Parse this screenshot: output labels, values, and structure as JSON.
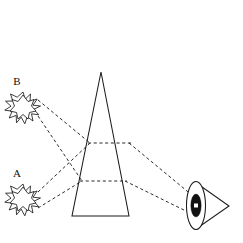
{
  "figure": {
    "background_color": "#ffffff",
    "stroke_color": "#1a1a1a",
    "ray_color": "#2b2b2b",
    "width": 243,
    "height": 243
  },
  "labels": {
    "source_b": "B",
    "source_a": "A"
  },
  "objects": {
    "source_b": {
      "name": "B",
      "shape": "star-burst",
      "points": 12,
      "center": {
        "x": 23,
        "y": 107
      },
      "outer_radius": 15,
      "inner_radius": 8
    },
    "source_a": {
      "name": "A",
      "shape": "star-burst",
      "points": 12,
      "center": {
        "x": 23,
        "y": 199
      },
      "outer_radius": 15,
      "inner_radius": 8
    },
    "prism": {
      "name": "prism",
      "shape": "triangle",
      "apex": {
        "x": 101,
        "y": 72
      },
      "base_left": {
        "x": 72,
        "y": 216
      },
      "base_right": {
        "x": 129,
        "y": 216
      }
    },
    "eye": {
      "name": "eye",
      "shape": "triangle-with-lens",
      "apex": {
        "x": 228,
        "y": 206
      },
      "top": {
        "x": 195,
        "y": 182
      },
      "bottom": {
        "x": 196,
        "y": 229
      },
      "lens_center": {
        "x": 196,
        "y": 205
      },
      "lens_rx": 9,
      "lens_ry": 24,
      "pupil_center": {
        "x": 196,
        "y": 205
      },
      "pupil_rx": 5,
      "pupil_ry": 11
    }
  },
  "rays": [
    {
      "name": "ray-b-upper",
      "from": "B",
      "to": "eye",
      "segments": [
        [
          38,
          100
        ],
        [
          90,
          143
        ],
        [
          129,
          143
        ],
        [
          193,
          196
        ]
      ]
    },
    {
      "name": "ray-b-lower",
      "from": "B",
      "to": "eye",
      "segments": [
        [
          38,
          116
        ],
        [
          82,
          181
        ],
        [
          125,
          181
        ],
        [
          192,
          214
        ]
      ]
    },
    {
      "name": "ray-a-upper",
      "from": "A",
      "to": "eye",
      "segments": [
        [
          38,
          192
        ],
        [
          90,
          143
        ],
        [
          129,
          143
        ],
        [
          193,
          196
        ]
      ]
    },
    {
      "name": "ray-a-lower",
      "from": "A",
      "to": "eye",
      "segments": [
        [
          38,
          208
        ],
        [
          82,
          181
        ],
        [
          125,
          181
        ],
        [
          192,
          214
        ]
      ]
    }
  ],
  "internal_paths": [
    {
      "name": "prism-chord-upper",
      "x1": 90,
      "y1": 143,
      "x2": 129,
      "y2": 143
    },
    {
      "name": "prism-chord-lower",
      "x1": 82,
      "y1": 181,
      "x2": 125,
      "y2": 181
    }
  ]
}
